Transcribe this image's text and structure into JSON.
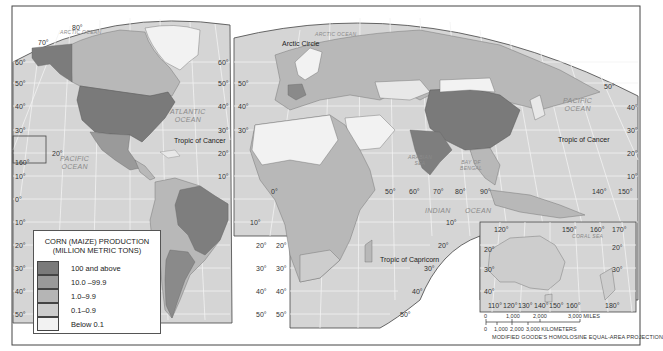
{
  "map": {
    "title": "CORN (MAIZE) PRODUCTION",
    "subtitle": "(MILLION METRIC TONS)",
    "projection": "MODIFIED GOODE'S HOMOLOSINE EQUAL-AREA PROJECTION",
    "colors": {
      "ocean": "#d7d7d7",
      "graticule": "#f4f4f4",
      "border": "#555555",
      "land_100_plus": "#7a7a7a",
      "land_10_99": "#9a9a9a",
      "land_1_9": "#b5b5b5",
      "land_01_09": "#cdcdcd",
      "land_below_01": "#f2f2f2"
    }
  },
  "legend": {
    "title_line1": "CORN (MAIZE) PRODUCTION",
    "title_line2": "(MILLION METRIC TONS)",
    "items": [
      {
        "label": "100 and above",
        "color": "#7a7a7a"
      },
      {
        "label": "10.0 –99.9",
        "color": "#9a9a9a"
      },
      {
        "label": "1.0–9.9",
        "color": "#b5b5b5"
      },
      {
        "label": "0.1–0.9",
        "color": "#cdcdcd"
      },
      {
        "label": "Below 0.1",
        "color": "#f2f2f2"
      }
    ]
  },
  "oceans": {
    "arctic_left": "ARCTIC OCEAN",
    "arctic_right": "ARCTIC OCEAN",
    "atlantic": "ATLANTIC\nOCEAN",
    "pacific_left": "PACIFIC\nOCEAN",
    "pacific_right": "PACIFIC\nOCEAN",
    "indian_1": "INDIAN",
    "indian_2": "OCEAN",
    "arabian_sea": "ARABIAN\nSEA",
    "bay_of_bengal": "BAY OF\nBENGAL",
    "coral_sea": "CORAL SEA"
  },
  "lines": {
    "arctic_circle": "Arctic Circle",
    "tropic_of_cancer_left": "Tropic of Cancer",
    "tropic_of_cancer_right": "Tropic of Cancer",
    "tropic_of_capricorn": "Tropic of Capricorn"
  },
  "latitude_labels": {
    "left_outer": [
      "80",
      "70",
      "60",
      "50",
      "40",
      "30",
      "20",
      "10",
      "0",
      "10",
      "20",
      "30",
      "40",
      "50"
    ],
    "hawaii_inset": "160",
    "hawaii_20": "20"
  },
  "longitude_labels": {
    "bottom_row": [
      "0",
      "50",
      "60",
      "70",
      "80",
      "90",
      "140",
      "150"
    ],
    "australia_top": [
      "120",
      "150",
      "160",
      "170"
    ],
    "australia_bottom": [
      "110",
      "120",
      "130",
      "140",
      "150",
      "160",
      "180"
    ]
  },
  "scale": {
    "miles_ticks": [
      "0",
      "1,000",
      "2,000",
      "3,000 MILES"
    ],
    "km_ticks": [
      "0",
      "1,000",
      "2,000",
      "3,000 KILOMETERS"
    ]
  }
}
